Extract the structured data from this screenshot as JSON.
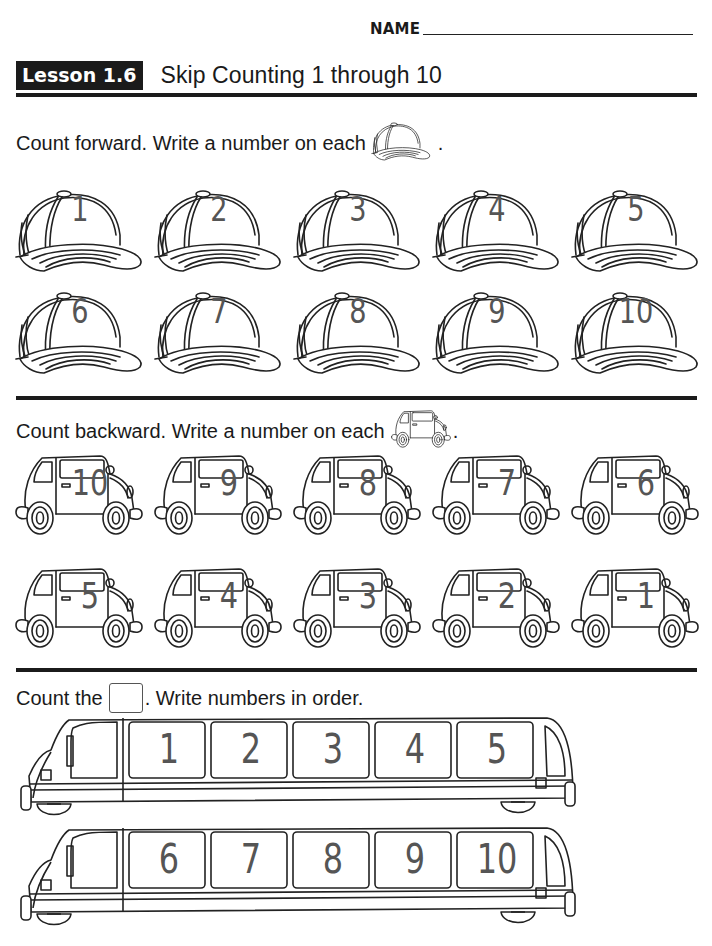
{
  "header": {
    "name_label": "NAME",
    "lesson_badge": "Lesson 1.6",
    "lesson_title": "Skip Counting 1 through 10"
  },
  "sections": {
    "forward": {
      "instruction": "Count forward. Write a number on each",
      "instruction_end": ".",
      "icon": "baseball-cap-icon",
      "answers": [
        "1",
        "2",
        "3",
        "4",
        "5",
        "6",
        "7",
        "8",
        "9",
        "10"
      ]
    },
    "backward": {
      "instruction": "Count backward. Write a number on each",
      "instruction_end": ".",
      "icon": "car-icon",
      "answers": [
        "10",
        "9",
        "8",
        "7",
        "6",
        "5",
        "4",
        "3",
        "2",
        "1"
      ]
    },
    "order": {
      "instruction_start": "Count the",
      "instruction_end": ". Write numbers in order.",
      "icon": "window-box-icon",
      "trains": [
        {
          "windows": [
            "1",
            "2",
            "3",
            "4",
            "5"
          ]
        },
        {
          "windows": [
            "6",
            "7",
            "8",
            "9",
            "10"
          ]
        }
      ]
    }
  }
}
